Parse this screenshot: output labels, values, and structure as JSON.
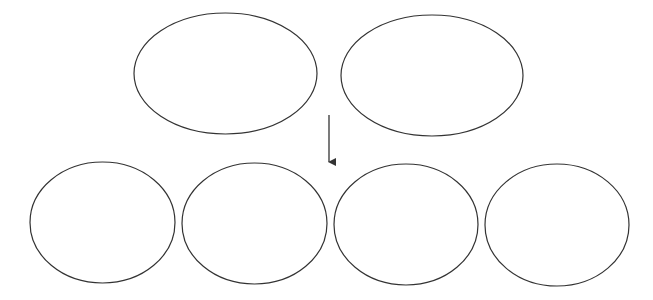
{
  "diagram": {
    "stroke_color": "#333333",
    "background": "#ffffff",
    "top_row": [
      {
        "id": "top-ellipse-1",
        "label": "",
        "cx": 225.5,
        "cy": 73.5,
        "rx": 91.5,
        "ry": 60.5
      },
      {
        "id": "top-ellipse-2",
        "label": "",
        "cx": 432,
        "cy": 75.5,
        "rx": 91,
        "ry": 60.5
      }
    ],
    "arrow": {
      "x": 329,
      "y1": 115,
      "y2": 170,
      "direction": "down"
    },
    "bottom_row": [
      {
        "id": "bottom-ellipse-1",
        "label": "",
        "cx": 102.5,
        "cy": 222.5,
        "rx": 72.5,
        "ry": 60.5
      },
      {
        "id": "bottom-ellipse-2",
        "label": "",
        "cx": 254.5,
        "cy": 223.5,
        "rx": 72.5,
        "ry": 60.5
      },
      {
        "id": "bottom-ellipse-3",
        "label": "",
        "cx": 406,
        "cy": 224.5,
        "rx": 72,
        "ry": 60.5
      },
      {
        "id": "bottom-ellipse-4",
        "label": "",
        "cx": 557,
        "cy": 225,
        "rx": 72,
        "ry": 61
      }
    ]
  }
}
